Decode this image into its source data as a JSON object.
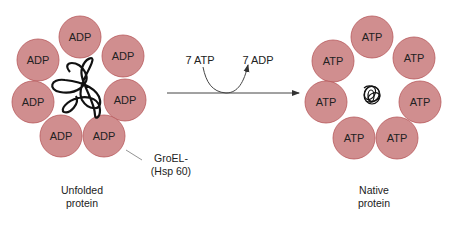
{
  "diagram": {
    "left": {
      "subunits": [
        "ADP",
        "ADP",
        "ADP",
        "ADP",
        "ADP",
        "ADP",
        "ADP"
      ],
      "caption_line1": "Unfolded",
      "caption_line2": "protein"
    },
    "right": {
      "subunits": [
        "ATP",
        "ATP",
        "ATP",
        "ATP",
        "ATP",
        "ATP",
        "ATP"
      ],
      "caption_line1": "Native",
      "caption_line2": "protein"
    },
    "reaction": {
      "input": "7 ATP",
      "output": "7 ADP"
    },
    "groel_label_line1": "GroEL-",
    "groel_label_line2": "(Hsp 60)",
    "colors": {
      "subunit_fill": "#d08e8f",
      "subunit_stroke": "#b8595c",
      "line": "#333333"
    }
  }
}
